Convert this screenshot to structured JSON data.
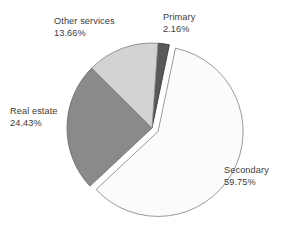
{
  "chart_data": {
    "type": "pie",
    "title": "",
    "subtitle": "",
    "xlabel": "",
    "ylabel": "",
    "legend_position": "none",
    "grid": false,
    "units": "percent",
    "exploded_slices": [
      "Secondary"
    ],
    "start_angle_deg": -86,
    "direction": "clockwise",
    "categories": [
      "Primary",
      "Secondary",
      "Real estate",
      "Other services"
    ],
    "values": [
      2.16,
      59.75,
      24.43,
      13.66
    ],
    "slices": [
      {
        "name": "Primary",
        "label": "Primary",
        "value": 2.16,
        "value_label": "2.16%",
        "color": "#595959",
        "edge_color": "#3a3a3a",
        "exploded": false
      },
      {
        "name": "Secondary",
        "label": "Secondary",
        "value": 59.75,
        "value_label": "59.75%",
        "color": "#fbfbfb",
        "edge_color": "#8d8d8d",
        "exploded": true
      },
      {
        "name": "Real estate",
        "label": "Real estate",
        "value": 24.43,
        "value_label": "24.43%",
        "color": "#8a8a8a",
        "edge_color": "#6f6f6f",
        "exploded": false
      },
      {
        "name": "Other services",
        "label": "Other services",
        "value": 13.66,
        "value_label": "13.66%",
        "color": "#d3d3d3",
        "edge_color": "#8d8d8d",
        "exploded": false
      }
    ]
  },
  "labels": {
    "primary": {
      "name": "Primary",
      "percent": "2.16%"
    },
    "secondary": {
      "name": "Secondary",
      "percent": "59.75%"
    },
    "real_estate": {
      "name": "Real estate",
      "percent": "24.43%"
    },
    "other_services": {
      "name": "Other services",
      "percent": "13.66%"
    }
  },
  "style": {
    "background": "#ffffff",
    "text_color": "#3c3c3c"
  }
}
